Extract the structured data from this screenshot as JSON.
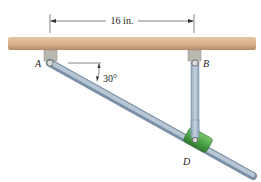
{
  "diagram": {
    "dimension_label": "16 in.",
    "angle_label": "30°",
    "point_labels": {
      "A": "A",
      "B": "B",
      "D": "D"
    },
    "colors": {
      "ceiling": "#d9b48f",
      "ceiling_shade": "#b8916c",
      "rod": "#9fb2c4",
      "rod_dark": "#6f8498",
      "collar": "#4fa64a",
      "collar_dark": "#2e7a2c",
      "bracket": "#b9b9b0",
      "link": "#a9bccd"
    }
  }
}
